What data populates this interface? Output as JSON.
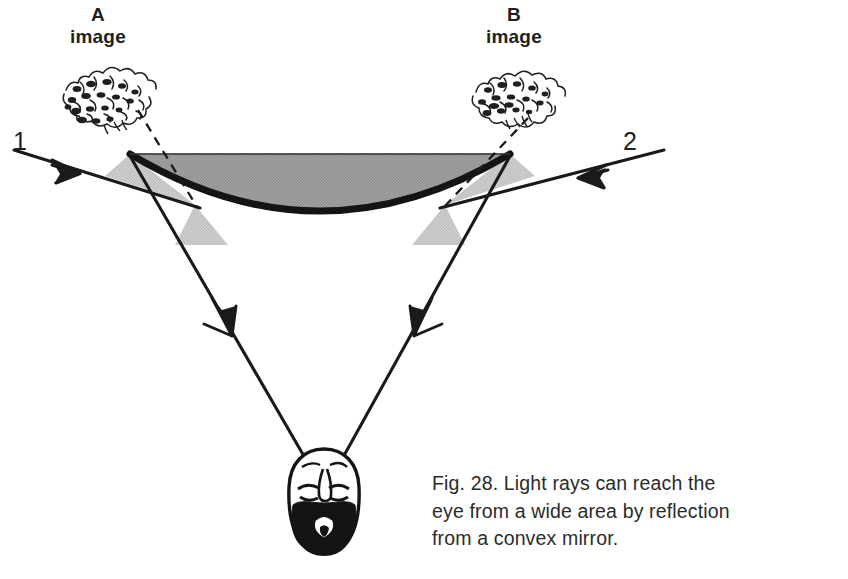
{
  "figure": {
    "id": "fig-28",
    "title": "Fig. 28. Light rays can reach the eye from a wide area by reflection from a convex mirror.",
    "caption_lines": [
      "Fig. 28. Light rays can reach the",
      "eye from a wide area by reflection",
      "from a convex mirror."
    ],
    "caption_line_1": "Fig. 28. Light rays can reach the",
    "caption_line_2": "eye from a wide area by reflection",
    "caption_line_3": "from a convex mirror."
  },
  "labels": {
    "image_a_letter": "A",
    "image_a_word": "image",
    "image_b_letter": "B",
    "image_b_word": "image",
    "ray_1": "1",
    "ray_2": "2"
  },
  "colors": {
    "background": "#ffffff",
    "ink": "#1a1a1a",
    "mirror_fill": "#9d9d9d",
    "mirror_rim": "#141414",
    "angle_fill": "#c9c9c9",
    "text": "#2b2b2b"
  },
  "elements": {
    "mirror_name": "convex-mirror",
    "eye_name": "observer-head",
    "image_a_name": "virtual-image-a-foliage",
    "image_b_name": "virtual-image-b-foliage",
    "incident_ray_1_name": "incident-ray-1",
    "incident_ray_2_name": "incident-ray-2",
    "reflected_ray_left_name": "reflected-ray-left",
    "reflected_ray_right_name": "reflected-ray-right",
    "dashed_a_name": "virtual-ray-a-dashed",
    "dashed_b_name": "virtual-ray-b-dashed"
  }
}
